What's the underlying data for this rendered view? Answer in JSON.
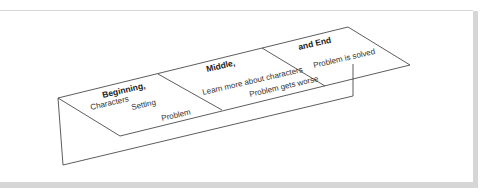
{
  "diagram": {
    "type": "folded-paper story map",
    "line_color": "#333333",
    "sections": [
      {
        "title": "Beginning,",
        "items": [
          "Characters",
          "Setting",
          "Problem"
        ]
      },
      {
        "title": "Middle,",
        "items": [
          "Learn more about characters",
          "Problem gets worse"
        ]
      },
      {
        "title": "and End",
        "items": [
          "Problem is solved"
        ]
      }
    ]
  }
}
